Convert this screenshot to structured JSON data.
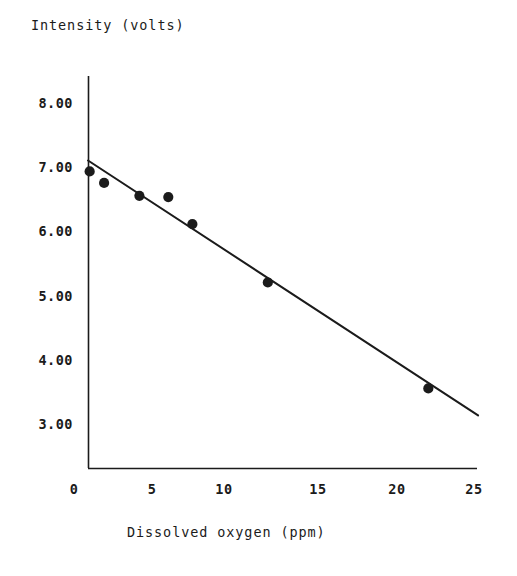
{
  "chart_data": {
    "type": "scatter",
    "title": "",
    "xlabel": "Dissolved oxygen (ppm)",
    "ylabel": "Intensity (volts)",
    "xlim": [
      0,
      25
    ],
    "ylim": [
      3.0,
      8.0
    ],
    "grid": false,
    "legend": null,
    "xticks": [
      "0",
      "5",
      "10",
      "15",
      "20",
      "25"
    ],
    "xtick_values": [
      0,
      5,
      10,
      15,
      20,
      25
    ],
    "yticks": [
      "8.00",
      "7.00",
      "6.00",
      "5.00",
      "4.00",
      "3.00"
    ],
    "ytick_values": [
      8.0,
      7.0,
      6.0,
      5.0,
      4.0,
      3.0
    ],
    "series": [
      {
        "name": "measured points",
        "marker": "filled-circle",
        "color": "#1b1b1b",
        "points": [
          {
            "x": 1.1,
            "y": 6.95
          },
          {
            "x": 2.0,
            "y": 6.77
          },
          {
            "x": 4.2,
            "y": 6.57
          },
          {
            "x": 6.0,
            "y": 6.55
          },
          {
            "x": 7.5,
            "y": 6.13
          },
          {
            "x": 12.2,
            "y": 5.22
          },
          {
            "x": 22.2,
            "y": 3.57
          }
        ]
      },
      {
        "name": "fitted line",
        "type": "line",
        "color": "#1b1b1b",
        "endpoints": [
          {
            "x": 1.0,
            "y": 7.12
          },
          {
            "x": 25.3,
            "y": 3.15
          }
        ]
      }
    ]
  },
  "axes": {
    "x_axis_name": "x-axis",
    "y_axis_name": "y-axis"
  }
}
